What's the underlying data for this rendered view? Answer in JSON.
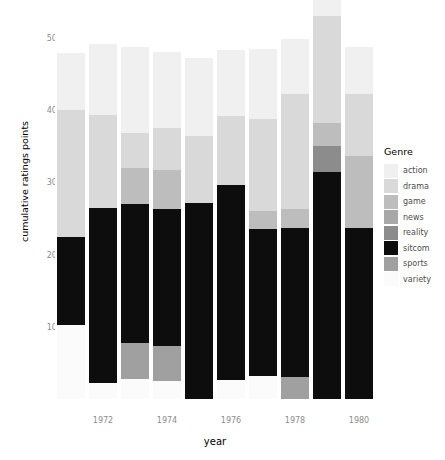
{
  "chart_data": {
    "type": "bar",
    "subtype": "stacked-bar",
    "title": "",
    "xlabel": "year",
    "ylabel": "cumulative ratings points",
    "ylim": [
      0,
      500
    ],
    "yticks": [
      0,
      100,
      200,
      300,
      400,
      500
    ],
    "xticks": [
      1972,
      1974,
      1976,
      1978,
      1980
    ],
    "categories": [
      1971,
      1972,
      1973,
      1974,
      1975,
      1976,
      1977,
      1978,
      1979,
      1980
    ],
    "grid": false,
    "legend_position": "right",
    "legend_title": "Genre",
    "stack_order_bottom_to_top": [
      "variety",
      "sports",
      "sitcom",
      "reality",
      "news",
      "game",
      "drama",
      "action"
    ],
    "series": [
      {
        "name": "action",
        "color": "#f0f0f0",
        "values": [
          79,
          98,
          119,
          104,
          108,
          92,
          97,
          77,
          63,
          64
        ]
      },
      {
        "name": "drama",
        "color": "#d9d9d9",
        "values": [
          175,
          130,
          48,
          59,
          93,
          95,
          127,
          159,
          147,
          86
        ]
      },
      {
        "name": "game",
        "color": "#bdbdbd",
        "values": [
          0,
          0,
          50,
          54,
          0,
          0,
          25,
          26,
          32,
          100
        ]
      },
      {
        "name": "news",
        "color": "#a8a8a8",
        "values": [
          0,
          0,
          0,
          0,
          0,
          0,
          0,
          0,
          0,
          0
        ]
      },
      {
        "name": "reality",
        "color": "#8c8c8c",
        "values": [
          0,
          0,
          0,
          0,
          0,
          0,
          0,
          0,
          37,
          0
        ]
      },
      {
        "name": "sitcom",
        "color": "#0d0d0d",
        "values": [
          122,
          242,
          193,
          190,
          271,
          270,
          204,
          206,
          314,
          237
        ]
      },
      {
        "name": "sports",
        "color": "#a0a0a0",
        "values": [
          0,
          0,
          49,
          48,
          0,
          0,
          0,
          31,
          0,
          0
        ]
      },
      {
        "name": "variety",
        "color": "#fbfbfb",
        "values": [
          103,
          22,
          28,
          25,
          0,
          27,
          32,
          0,
          0,
          0
        ]
      }
    ],
    "totals": [
      479,
      492,
      487,
      480,
      472,
      484,
      485,
      499,
      593,
      487
    ]
  },
  "legend": {
    "title": "Genre",
    "items": [
      {
        "label": "action",
        "color": "#f0f0f0"
      },
      {
        "label": "drama",
        "color": "#d9d9d9"
      },
      {
        "label": "game",
        "color": "#bdbdbd"
      },
      {
        "label": "news",
        "color": "#a8a8a8"
      },
      {
        "label": "reality",
        "color": "#8c8c8c"
      },
      {
        "label": "sitcom",
        "color": "#0d0d0d"
      },
      {
        "label": "sports",
        "color": "#a0a0a0"
      },
      {
        "label": "variety",
        "color": "#fbfbfb"
      }
    ]
  },
  "axes": {
    "x_title": "year",
    "y_title": "cumulative ratings points",
    "y_tick_labels": [
      "0",
      "100",
      "200",
      "300",
      "400",
      "500"
    ],
    "x_tick_labels": [
      "1972",
      "1974",
      "1976",
      "1978",
      "1980"
    ],
    "tick_color": "#8c8c8c"
  },
  "style": {
    "background": "#ffffff",
    "panel_background": "#ffffff",
    "text_color": "#000000"
  }
}
